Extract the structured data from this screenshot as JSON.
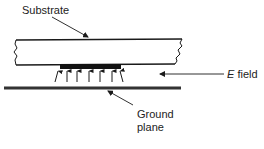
{
  "figure": {
    "type": "microstrip cross-section",
    "labels": {
      "substrate": "Substrate",
      "e_field_symbol": "E",
      "e_field_word": " field",
      "ground_line1": "Ground",
      "ground_line2": "plane"
    },
    "field_arrow_count": 7,
    "colors": {
      "ink": "#1a1a1a",
      "ground": "#333333",
      "background": "#ffffff"
    }
  }
}
